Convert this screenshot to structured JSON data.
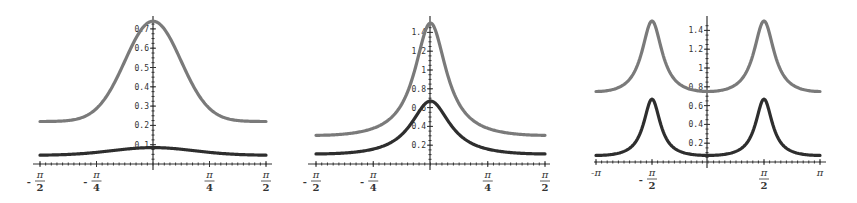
{
  "colors": {
    "light_series": "#7a7a7a",
    "dark_series": "#2e2e2e",
    "axis": "#333333"
  },
  "chart_data": [
    {
      "type": "line",
      "title": "",
      "xlabel": "",
      "ylabel": "",
      "xlim": [
        -1.5708,
        1.5708
      ],
      "ylim": [
        0,
        0.75
      ],
      "grid": false,
      "x_ticks": [
        {
          "value": -1.5708,
          "label_num": "π",
          "label_den": "2",
          "sign": "-"
        },
        {
          "value": -0.7854,
          "label_num": "π",
          "label_den": "4",
          "sign": "-"
        },
        {
          "value": 0.7854,
          "label_num": "π",
          "label_den": "4",
          "sign": ""
        },
        {
          "value": 1.5708,
          "label_num": "π",
          "label_den": "2",
          "sign": ""
        }
      ],
      "y_ticks": [
        "0.1",
        "0.2",
        "0.3",
        "0.4",
        "0.5",
        "0.6",
        "0.7"
      ],
      "series": [
        {
          "name": "light",
          "shape": "peak at 0",
          "x": [
            -1.5708,
            -0.7854,
            0,
            0.7854,
            1.5708
          ],
          "values": [
            0.22,
            0.32,
            0.74,
            0.32,
            0.22
          ]
        },
        {
          "name": "dark",
          "shape": "flat bump at 0",
          "x": [
            -1.5708,
            -0.7854,
            0,
            0.7854,
            1.5708
          ],
          "values": [
            0.045,
            0.06,
            0.085,
            0.06,
            0.045
          ]
        }
      ]
    },
    {
      "type": "line",
      "title": "",
      "xlabel": "",
      "ylabel": "",
      "xlim": [
        -1.5708,
        1.5708
      ],
      "ylim": [
        0,
        1.5
      ],
      "grid": false,
      "x_ticks": [
        {
          "value": -1.5708,
          "label_num": "π",
          "label_den": "2",
          "sign": "-"
        },
        {
          "value": -0.7854,
          "label_num": "π",
          "label_den": "4",
          "sign": "-"
        },
        {
          "value": 0.7854,
          "label_num": "π",
          "label_den": "4",
          "sign": ""
        },
        {
          "value": 1.5708,
          "label_num": "π",
          "label_den": "2",
          "sign": ""
        }
      ],
      "y_ticks": [
        "0.2",
        "0.4",
        "0.6",
        "0.8",
        "1",
        "1.2",
        "1.4"
      ],
      "series": [
        {
          "name": "light",
          "shape": "sharp peak at 0",
          "x": [
            -1.5708,
            -0.7854,
            -0.3,
            0,
            0.3,
            0.7854,
            1.5708
          ],
          "values": [
            0.22,
            0.3,
            0.48,
            1.5,
            0.48,
            0.3,
            0.22
          ]
        },
        {
          "name": "dark",
          "shape": "peak at 0",
          "x": [
            -1.5708,
            -0.7854,
            -0.3,
            0,
            0.3,
            0.7854,
            1.5708
          ],
          "values": [
            0.05,
            0.12,
            0.46,
            0.67,
            0.46,
            0.12,
            0.05
          ]
        }
      ]
    },
    {
      "type": "line",
      "title": "",
      "xlabel": "",
      "ylabel": "",
      "xlim": [
        -3.1416,
        3.1416
      ],
      "ylim": [
        0,
        1.5
      ],
      "grid": false,
      "x_ticks": [
        {
          "value": -3.1416,
          "label": "-π"
        },
        {
          "value": -1.5708,
          "label_num": "π",
          "label_den": "2",
          "sign": "-"
        },
        {
          "value": 1.5708,
          "label_num": "π",
          "label_den": "2",
          "sign": ""
        },
        {
          "value": 3.1416,
          "label": "π"
        }
      ],
      "y_ticks": [
        "0.2",
        "0.4",
        "0.6",
        "0.8",
        "1",
        "1.2",
        "1.4"
      ],
      "series": [
        {
          "name": "light",
          "shape": "peaks at ±π/2",
          "x": [
            -3.1416,
            -1.5708,
            0,
            1.5708,
            3.1416
          ],
          "values": [
            0.75,
            1.5,
            0.75,
            1.5,
            0.75
          ]
        },
        {
          "name": "dark",
          "shape": "peaks at ±π/2",
          "x": [
            -3.1416,
            -1.5708,
            0,
            1.5708,
            3.1416
          ],
          "values": [
            0.07,
            0.67,
            0.07,
            0.67,
            0.07
          ]
        }
      ]
    }
  ]
}
